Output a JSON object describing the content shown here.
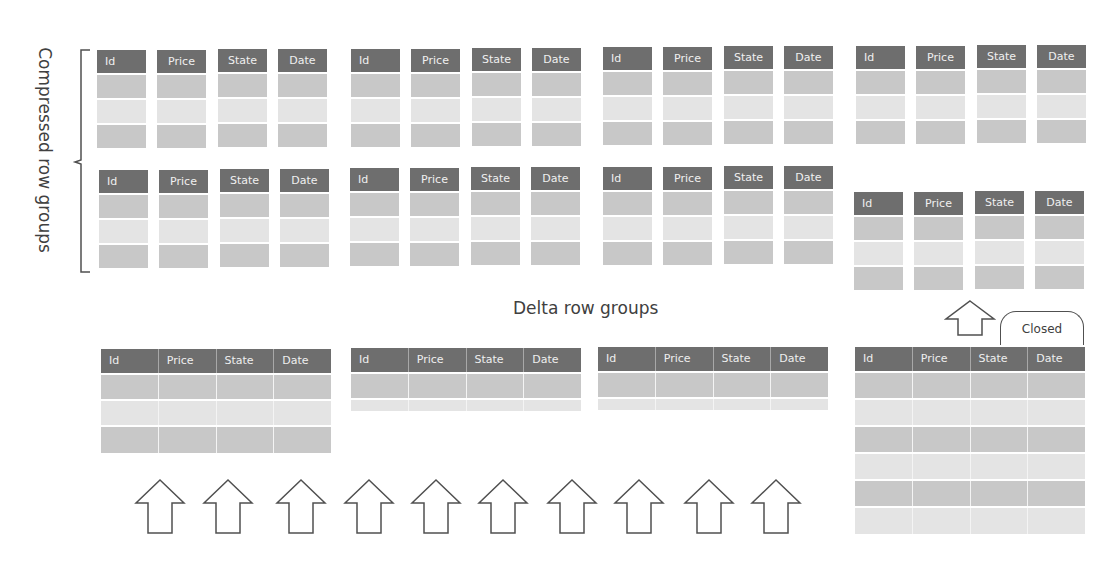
{
  "labels": {
    "compressed": "Compressed row groups",
    "delta": "Delta row groups",
    "closed": "Closed"
  },
  "columns": [
    "Id",
    "Price",
    "State",
    "Date"
  ],
  "compressed_row_groups": [
    {
      "row": 1,
      "position": 1,
      "rows": 3
    },
    {
      "row": 1,
      "position": 2,
      "rows": 3
    },
    {
      "row": 1,
      "position": 3,
      "rows": 3
    },
    {
      "row": 1,
      "position": 4,
      "rows": 3
    },
    {
      "row": 2,
      "position": 1,
      "rows": 3
    },
    {
      "row": 2,
      "position": 2,
      "rows": 3
    },
    {
      "row": 2,
      "position": 3,
      "rows": 3
    },
    {
      "row": 2,
      "position": 4,
      "rows": 3,
      "note": "newly compressed from closed delta row group"
    }
  ],
  "delta_row_groups": [
    {
      "position": 1,
      "rows": 3,
      "state": "open"
    },
    {
      "position": 2,
      "rows": 2,
      "state": "open"
    },
    {
      "position": 3,
      "rows": 2,
      "state": "open"
    },
    {
      "position": 4,
      "rows": 6,
      "state": "Closed"
    }
  ],
  "insert_arrows": {
    "count": 10,
    "icon": "up-arrow-outline"
  },
  "colors": {
    "header": "#6e6e6e",
    "header_text": "#f0f0f0",
    "row_dark": "#c8c8c8",
    "row_light": "#e4e4e4",
    "text": "#404040",
    "outline": "#505050"
  }
}
